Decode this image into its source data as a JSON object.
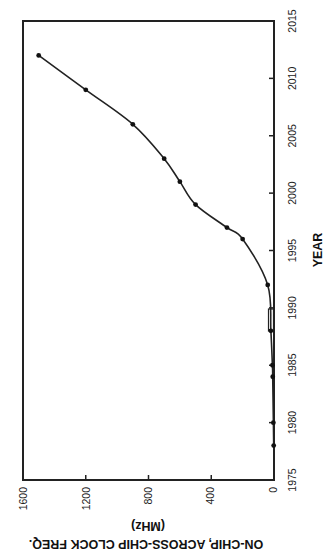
{
  "chart_data": {
    "type": "line",
    "orientation_note": "figure rotated 90 degrees counter-clockwise",
    "title": "",
    "xlabel": "YEAR",
    "ylabel": "ON-CHIP, ACROSS-CHIP CLOCK FREQ.",
    "ylabel_units": "(MHz)",
    "xlim": [
      1975,
      2015
    ],
    "ylim": [
      0,
      1600
    ],
    "x_ticks": [
      1975,
      1980,
      1985,
      1990,
      1995,
      2000,
      2005,
      2010,
      2015
    ],
    "y_ticks": [
      0,
      400,
      800,
      1200,
      1600
    ],
    "grid": false,
    "legend": null,
    "series": [
      {
        "name": "clock frequency",
        "x": [
          1978,
          1980,
          1984,
          1985,
          1988,
          1992,
          1996,
          1997,
          1999,
          2001,
          2003,
          2006,
          2009,
          2012
        ],
        "values": [
          2,
          4,
          8,
          10,
          20,
          40,
          200,
          300,
          500,
          600,
          700,
          900,
          1200,
          1500
        ]
      }
    ],
    "line_color": "#222222",
    "marker": "dot"
  },
  "labels": {
    "x_title": "YEAR",
    "y_title": "ON-CHIP, ACROSS-CHIP CLOCK FREQ.",
    "y_units": "(MHz)",
    "x_ticks": [
      "1975",
      "1980",
      "1985",
      "1990",
      "1995",
      "2000",
      "2005",
      "2010",
      "2015"
    ],
    "y_ticks": [
      "0",
      "400",
      "800",
      "1200",
      "1600"
    ]
  }
}
